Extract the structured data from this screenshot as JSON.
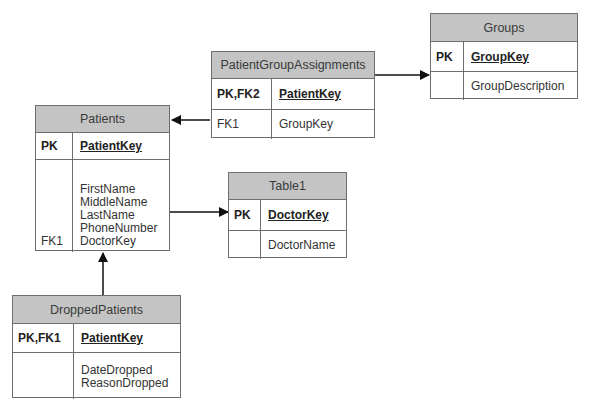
{
  "diagram": {
    "type": "entity-relationship",
    "colors": {
      "header_fill": "#c4c4c4",
      "border": "#6e6e6e",
      "line": "#111111"
    }
  },
  "entities": {
    "patients": {
      "title": "Patients",
      "pk_key": "PK",
      "pk_field": "PatientKey",
      "fields": [
        "FirstName",
        "MiddleName",
        "LastName",
        "PhoneNumber",
        "DoctorKey"
      ],
      "field_keys": [
        "",
        "",
        "",
        "",
        "FK1"
      ]
    },
    "patient_group_assignments": {
      "title": "PatientGroupAssignments",
      "pk_key": "PK,FK2",
      "pk_field": "PatientKey",
      "fields": [
        "GroupKey"
      ],
      "field_keys": [
        "FK1"
      ]
    },
    "groups": {
      "title": "Groups",
      "pk_key": "PK",
      "pk_field": "GroupKey",
      "fields": [
        "GroupDescription"
      ],
      "field_keys": [
        ""
      ]
    },
    "table1": {
      "title": "Table1",
      "pk_key": "PK",
      "pk_field": "DoctorKey",
      "fields": [
        "DoctorName"
      ],
      "field_keys": [
        ""
      ]
    },
    "dropped_patients": {
      "title": "DroppedPatients",
      "pk_key": "PK,FK1",
      "pk_field": "PatientKey",
      "fields": [
        "DateDropped",
        "ReasonDropped"
      ],
      "field_keys": [
        "",
        ""
      ]
    }
  },
  "relationships": [
    {
      "from": "PatientGroupAssignments",
      "to": "Patients"
    },
    {
      "from": "PatientGroupAssignments",
      "to": "Groups"
    },
    {
      "from": "Patients",
      "to": "Table1"
    },
    {
      "from": "DroppedPatients",
      "to": "Patients"
    }
  ]
}
